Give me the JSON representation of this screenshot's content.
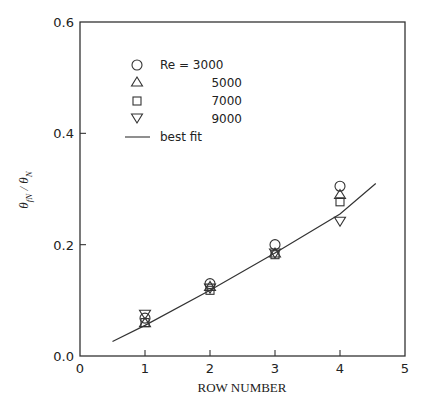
{
  "chart_data": {
    "type": "scatter",
    "title": "",
    "xlabel": "ROW NUMBER",
    "ylabel": "θ_fN / θ_N",
    "xlim": [
      0,
      5
    ],
    "ylim": [
      0.0,
      0.6
    ],
    "xticks": [
      0,
      1,
      2,
      3,
      4,
      5
    ],
    "yticks": [
      "0.0",
      "0.2",
      "0.4",
      "0.6"
    ],
    "grid": false,
    "legend_position": "upper-left inside",
    "series": [
      {
        "name": "Re = 3000",
        "marker": "circle",
        "x": [
          1,
          2,
          3,
          4
        ],
        "values": [
          0.068,
          0.13,
          0.2,
          0.305
        ]
      },
      {
        "name": "5000",
        "marker": "triangle-up",
        "x": [
          1,
          2,
          3,
          4
        ],
        "values": [
          0.06,
          0.125,
          0.185,
          0.29
        ]
      },
      {
        "name": "7000",
        "marker": "square",
        "x": [
          1,
          2,
          3,
          4
        ],
        "values": [
          0.06,
          0.118,
          0.182,
          0.277
        ]
      },
      {
        "name": "9000",
        "marker": "triangle-down",
        "x": [
          1,
          2,
          3,
          4
        ],
        "values": [
          0.075,
          0.122,
          0.185,
          0.242
        ]
      },
      {
        "name": "best fit",
        "marker": "line",
        "x": [
          0.5,
          1,
          2,
          3,
          4,
          4.55
        ],
        "values": [
          0.026,
          0.055,
          0.118,
          0.185,
          0.255,
          0.31
        ]
      }
    ]
  },
  "legend": {
    "items": [
      {
        "marker": "circle",
        "label": "Re  =  3000"
      },
      {
        "marker": "triangle-up",
        "label": "5000"
      },
      {
        "marker": "square",
        "label": "7000"
      },
      {
        "marker": "triangle-down",
        "label": "9000"
      },
      {
        "marker": "line",
        "label": "best fit"
      }
    ]
  },
  "axes": {
    "x_title": "ROW NUMBER",
    "y_title_main": "θ",
    "y_title_sub1": "fN",
    "y_title_slash": " / θ",
    "y_title_sub2": "N",
    "x_tick_labels": [
      "0",
      "1",
      "2",
      "3",
      "4",
      "5"
    ],
    "y_tick_labels": [
      "0.0",
      "0.2",
      "0.4",
      "0.6"
    ]
  }
}
